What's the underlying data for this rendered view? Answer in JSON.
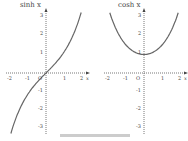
{
  "chart_data": [
    {
      "type": "line",
      "title": "sinh x",
      "function": "sinh",
      "xlabel": "x",
      "x_ticks": [
        "-2",
        "-1",
        "O",
        "1",
        "2"
      ],
      "y_ticks": [
        "3",
        "2",
        "1",
        "-1",
        "-2",
        "-3"
      ],
      "xlim": [
        -2.2,
        2.2
      ],
      "ylim": [
        -3.3,
        3.3
      ],
      "x": [
        -1.9,
        -1.5,
        -1,
        -0.5,
        0,
        0.5,
        1,
        1.5,
        1.9
      ],
      "y": [
        -3.27,
        -2.13,
        -1.18,
        -0.52,
        0,
        0.52,
        1.18,
        2.13,
        3.27
      ]
    },
    {
      "type": "line",
      "title": "cosh x",
      "function": "cosh",
      "xlabel": "x",
      "x_ticks": [
        "-2",
        "-1",
        "O",
        "1",
        "2"
      ],
      "y_ticks": [
        "3",
        "2",
        "1",
        "-1",
        "-2",
        "-3"
      ],
      "xlim": [
        -2.2,
        2.2
      ],
      "ylim": [
        -3.3,
        3.3
      ],
      "x": [
        -1.9,
        -1.5,
        -1,
        -0.5,
        0,
        0.5,
        1,
        1.5,
        1.9
      ],
      "y": [
        3.42,
        2.35,
        1.54,
        1.13,
        1,
        1.13,
        1.54,
        2.35,
        3.42
      ]
    }
  ],
  "labels": {
    "left_title": "sinh x",
    "right_title": "cosh x",
    "x_axis": "x",
    "origin": "O"
  }
}
